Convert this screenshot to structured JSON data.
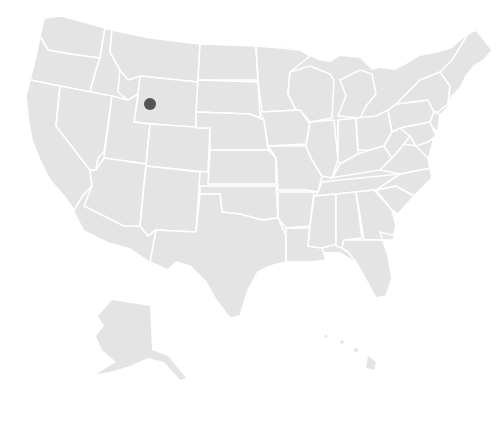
{
  "map": {
    "title": "United States map",
    "colors": {
      "land": "#e4e4e4",
      "border": "#ffffff",
      "background": "#ffffff",
      "marker": "#555555"
    },
    "markers": [
      {
        "label": "Wyoming",
        "x": 150,
        "y": 104,
        "r": 6
      }
    ]
  }
}
